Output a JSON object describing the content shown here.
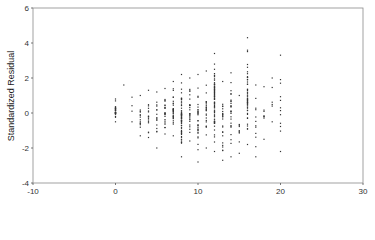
{
  "chart_data": {
    "type": "scatter",
    "title": "",
    "xlabel": "",
    "ylabel": "Standardized Residual",
    "xlim": [
      -10,
      30
    ],
    "ylim": [
      -4,
      6
    ],
    "x_ticks": [
      -10,
      0,
      10,
      20,
      30
    ],
    "y_ticks": [
      -4,
      -2,
      0,
      2,
      4,
      6
    ],
    "x_tick_labels": [
      "-10",
      "0",
      "10",
      "20",
      "30"
    ],
    "y_tick_labels": [
      "-4",
      "-2",
      "0",
      "2",
      "4",
      "6"
    ],
    "grid": false,
    "legend": null,
    "marker_color": "#333333",
    "frame_color": "#888888",
    "columns": [
      {
        "x": 0,
        "ymin": -0.5,
        "ymax": 0.8,
        "n": 30
      },
      {
        "x": 1,
        "ymin": 1.6,
        "ymax": 1.6,
        "n": 1
      },
      {
        "x": 2,
        "ymin": -0.5,
        "ymax": 0.9,
        "n": 4
      },
      {
        "x": 3,
        "ymin": -1.3,
        "ymax": 1.0,
        "n": 14
      },
      {
        "x": 4,
        "ymin": -1.4,
        "ymax": 1.3,
        "n": 16
      },
      {
        "x": 5,
        "ymin": -2.0,
        "ymax": 1.2,
        "n": 16
      },
      {
        "x": 6,
        "ymin": -1.2,
        "ymax": 1.4,
        "n": 22
      },
      {
        "x": 7,
        "ymin": -1.3,
        "ymax": 1.8,
        "n": 30
      },
      {
        "x": 8,
        "ymin": -2.5,
        "ymax": 2.2,
        "n": 60
      },
      {
        "x": 9,
        "ymin": -1.6,
        "ymax": 2.0,
        "n": 26
      },
      {
        "x": 10,
        "ymin": -2.8,
        "ymax": 2.2,
        "n": 30
      },
      {
        "x": 11,
        "ymin": -2.0,
        "ymax": 2.4,
        "n": 24
      },
      {
        "x": 12,
        "ymin": -2.2,
        "ymax": 3.4,
        "n": 70
      },
      {
        "x": 13,
        "ymin": -2.7,
        "ymax": 1.8,
        "n": 24
      },
      {
        "x": 14,
        "ymin": -2.5,
        "ymax": 2.3,
        "n": 26
      },
      {
        "x": 15,
        "ymin": -2.3,
        "ymax": 1.0,
        "n": 10
      },
      {
        "x": 16,
        "ymin": -1.8,
        "ymax": 4.3,
        "n": 50
      },
      {
        "x": 17,
        "ymin": -2.5,
        "ymax": 1.6,
        "n": 12
      },
      {
        "x": 18,
        "ymin": -1.5,
        "ymax": 1.5,
        "n": 8
      },
      {
        "x": 19,
        "ymin": -0.5,
        "ymax": 2.0,
        "n": 6
      },
      {
        "x": 20,
        "ymin": -2.2,
        "ymax": 3.3,
        "n": 12
      }
    ]
  },
  "axes": {
    "ylabel": "Standardized Residual"
  }
}
